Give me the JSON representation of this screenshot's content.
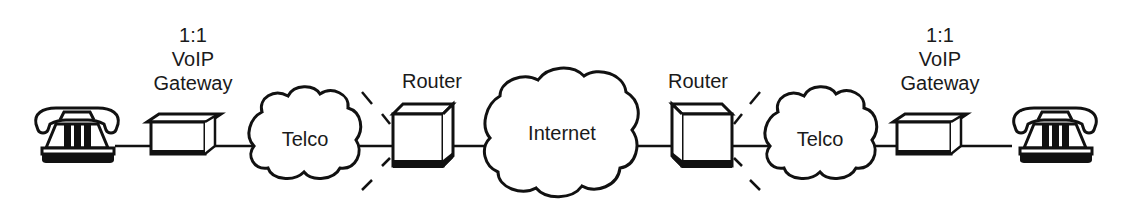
{
  "diagram": {
    "type": "network-path",
    "connection_line": "single horizontal link",
    "nodes": [
      {
        "id": "phone-left",
        "kind": "telephone",
        "label": ""
      },
      {
        "id": "gateway-left",
        "kind": "voip-gateway",
        "label_lines": [
          "1:1",
          "VoIP",
          "Gateway"
        ]
      },
      {
        "id": "telco-left",
        "kind": "cloud",
        "label": "Telco"
      },
      {
        "id": "router-left",
        "kind": "router",
        "label": "Router"
      },
      {
        "id": "internet",
        "kind": "cloud",
        "label": "Internet"
      },
      {
        "id": "router-right",
        "kind": "router",
        "label": "Router"
      },
      {
        "id": "telco-right",
        "kind": "cloud",
        "label": "Telco"
      },
      {
        "id": "gateway-right",
        "kind": "voip-gateway",
        "label_lines": [
          "1:1",
          "VoIP",
          "Gateway"
        ]
      },
      {
        "id": "phone-right",
        "kind": "telephone",
        "label": ""
      }
    ],
    "edges": [
      [
        "phone-left",
        "gateway-left"
      ],
      [
        "gateway-left",
        "telco-left"
      ],
      [
        "telco-left",
        "router-left"
      ],
      [
        "router-left",
        "internet"
      ],
      [
        "internet",
        "router-right"
      ],
      [
        "router-right",
        "telco-right"
      ],
      [
        "telco-right",
        "gateway-right"
      ],
      [
        "gateway-right",
        "phone-right"
      ]
    ],
    "colors": {
      "ink": "#111111",
      "background": "#ffffff"
    }
  },
  "labels": {
    "gateway_left": {
      "line1": "1:1",
      "line2": "VoIP",
      "line3": "Gateway"
    },
    "gateway_right": {
      "line1": "1:1",
      "line2": "VoIP",
      "line3": "Gateway"
    },
    "telco_left": "Telco",
    "router_left": "Router",
    "internet": "Internet",
    "router_right": "Router",
    "telco_right": "Telco"
  }
}
